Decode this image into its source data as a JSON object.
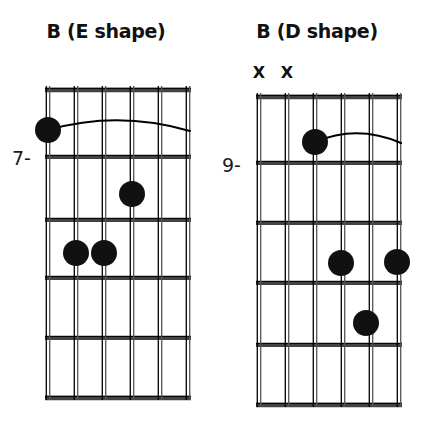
{
  "page": {
    "background_color": "#ffffff",
    "ink_color": "#1a1a1a",
    "dot_color": "#111111",
    "width": 423,
    "height": 437
  },
  "diagrams": [
    {
      "id": "left",
      "title": "B (E shape)",
      "fret_label": "7-",
      "start_fret": 7,
      "string_count": 6,
      "fret_count": 5,
      "grid": {
        "x0": 48,
        "x1": 188,
        "y_top": 90,
        "y_bottom": 398,
        "string_spacing": 28,
        "fret_spacing": 62
      },
      "fret_lines_y": [
        90,
        157,
        220,
        278,
        338,
        398
      ],
      "strings_x": [
        48,
        76,
        104,
        132,
        160,
        188
      ],
      "mutes": [],
      "barre": {
        "from_string": 1,
        "to_string": 6,
        "fret": 1,
        "arc_y": 130,
        "arc_bow": 10
      },
      "dots": [
        {
          "string": 1,
          "fret": 1,
          "cx": 48,
          "cy": 130,
          "r": 13
        },
        {
          "string": 4,
          "fret": 2,
          "cx": 132,
          "cy": 194,
          "r": 13
        },
        {
          "string": 2,
          "fret": 3,
          "cx": 76,
          "cy": 253,
          "r": 13
        },
        {
          "string": 3,
          "fret": 3,
          "cx": 104,
          "cy": 253,
          "r": 13
        }
      ]
    },
    {
      "id": "right",
      "title": "B (D shape)",
      "fret_label": "9-",
      "start_fret": 9,
      "string_count": 6,
      "fret_count": 5,
      "grid": {
        "x0": 259,
        "x1": 399,
        "y_top": 97,
        "y_bottom": 405,
        "string_spacing": 28,
        "fret_spacing": 62
      },
      "fret_lines_y": [
        97,
        163,
        223,
        283,
        345,
        405
      ],
      "strings_x": [
        259,
        287,
        315,
        343,
        371,
        399
      ],
      "mutes": [
        {
          "string": 1,
          "mark": "X",
          "x": 259,
          "y": 73
        },
        {
          "string": 2,
          "mark": "X",
          "x": 287,
          "y": 73
        }
      ],
      "barre": {
        "from_string": 3,
        "to_string": 6,
        "fret": 1,
        "arc_y": 142,
        "arc_bow": 9
      },
      "dots": [
        {
          "string": 3,
          "fret": 1,
          "cx": 315,
          "cy": 142,
          "r": 13
        },
        {
          "string": 4,
          "fret": 3,
          "cx": 341,
          "cy": 263,
          "r": 13
        },
        {
          "string": 6,
          "fret": 3,
          "cx": 397,
          "cy": 262,
          "r": 13
        },
        {
          "string": 5,
          "fret": 4,
          "cx": 366,
          "cy": 323,
          "r": 13
        }
      ]
    }
  ]
}
